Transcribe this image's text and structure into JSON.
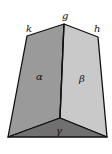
{
  "figure": {
    "type": "geometric solid (frustum-like dihedral wedge)",
    "vertex_labels": {
      "k": "k",
      "g": "g",
      "h": "h"
    },
    "face_labels": {
      "alpha": "α",
      "beta": "β",
      "gamma": "γ"
    },
    "colors": {
      "face_alpha": "#9a9a9a",
      "face_beta": "#c8c8c8",
      "face_gamma": "#6e6e6e",
      "edge": "#111111",
      "background": "#ffffff"
    }
  }
}
